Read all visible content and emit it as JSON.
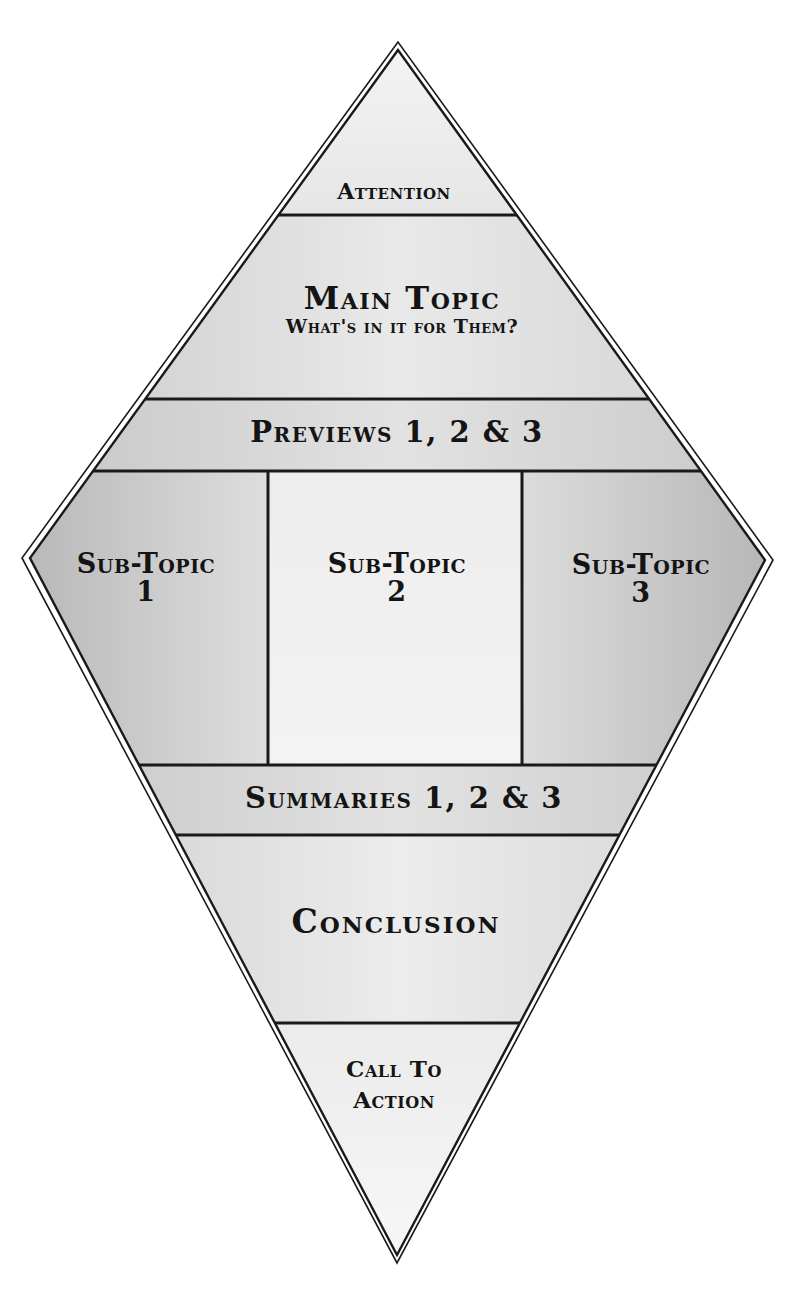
{
  "diagram": {
    "sections": {
      "attention": {
        "label": "Attention"
      },
      "main_topic": {
        "label": "Main Topic",
        "sublabel": "What's in it for Them?"
      },
      "previews": {
        "label": "Previews 1, 2 & 3"
      },
      "subtopics": [
        {
          "label": "Sub-Topic",
          "number": "1"
        },
        {
          "label": "Sub-Topic",
          "number": "2"
        },
        {
          "label": "Sub-Topic",
          "number": "3"
        }
      ],
      "summaries": {
        "label": "Summaries 1, 2 & 3"
      },
      "conclusion": {
        "label": "Conclusion"
      },
      "call_to_action": {
        "line1": "Call To",
        "line2": "Action"
      }
    },
    "colors": {
      "outline": "#1a1a1a",
      "fill_light": "#ececec",
      "fill_mid": "#d8d8d8",
      "fill_dark": "#b8b8b8",
      "text": "#141414"
    }
  }
}
